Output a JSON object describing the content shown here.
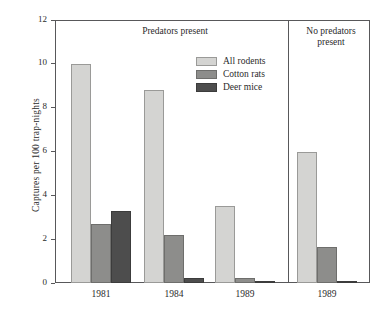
{
  "chart_data": {
    "type": "bar",
    "title": "",
    "xlabel": "",
    "ylabel": "Captures per 100 trap-nights",
    "ylim": [
      0,
      12
    ],
    "yticks": [
      0,
      2,
      4,
      6,
      8,
      10,
      12
    ],
    "ytick_labels": [
      "0",
      "2",
      "4",
      "6",
      "8",
      "10",
      "12"
    ],
    "grid": false,
    "legend_position": "upper-center",
    "categories": [
      "1981",
      "1984",
      "1989",
      "1989"
    ],
    "panels": [
      {
        "label": "Predators present",
        "label_lines": [
          "Predators present"
        ],
        "categories": [
          "1981",
          "1984",
          "1989"
        ]
      },
      {
        "label": "No predators present",
        "label_lines": [
          "No predators",
          "present"
        ],
        "categories": [
          "1989"
        ]
      }
    ],
    "series": [
      {
        "name": "All rodents",
        "color": "#d4d4d2",
        "values": [
          10.0,
          8.8,
          3.5,
          6.0
        ]
      },
      {
        "name": "Cotton rats",
        "color": "#8d8d8b",
        "values": [
          2.7,
          2.2,
          0.25,
          1.65
        ]
      },
      {
        "name": "Deer mice",
        "color": "#4d4d4d",
        "values": [
          3.3,
          0.25,
          0.05,
          0.05
        ]
      }
    ]
  },
  "legend": {
    "items": [
      {
        "label": "All rodents"
      },
      {
        "label": "Cotton rats"
      },
      {
        "label": "Deer mice"
      }
    ]
  },
  "axis": {
    "y_title": "Captures per 100 trap-nights"
  }
}
